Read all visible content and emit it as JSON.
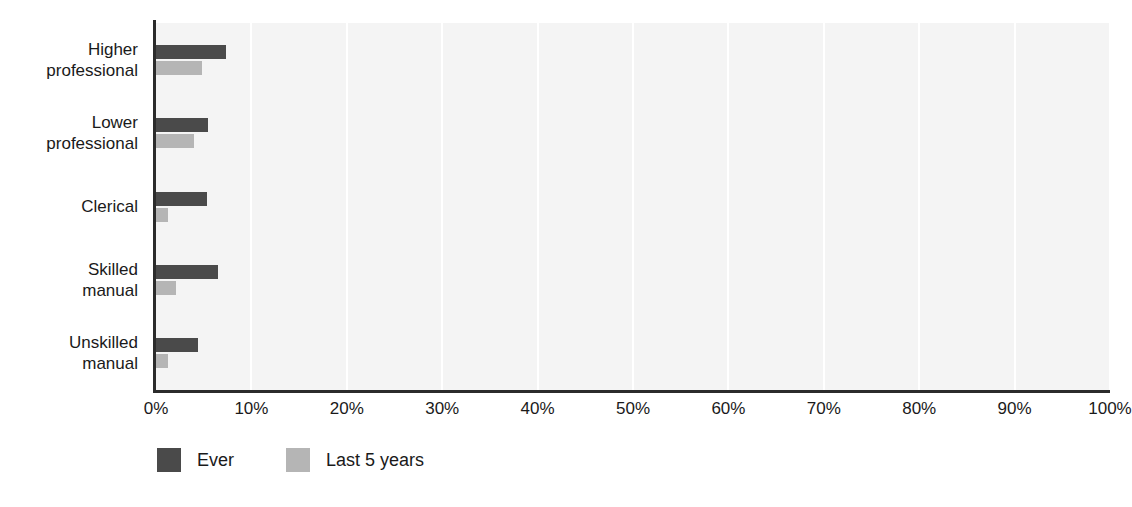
{
  "chart_data": {
    "type": "bar",
    "orientation": "horizontal",
    "title": "",
    "subtitle": "",
    "xlabel": "",
    "ylabel": "",
    "xlim": [
      0,
      100
    ],
    "xtick_labels": [
      "0%",
      "10%",
      "20%",
      "30%",
      "40%",
      "50%",
      "60%",
      "70%",
      "80%",
      "90%",
      "100%"
    ],
    "xtick_values": [
      0,
      10,
      20,
      30,
      40,
      50,
      60,
      70,
      80,
      90,
      100
    ],
    "grid": "vertical",
    "legend_position": "bottom-left",
    "categories": [
      "Higher\nprofessional",
      "Lower\nprofessional",
      "Clerical",
      "Skilled\nmanual",
      "Unskilled\nmanual"
    ],
    "series": [
      {
        "name": "Ever",
        "color": "#4a4a4a",
        "values": [
          7.3,
          5.5,
          5.3,
          6.5,
          4.4
        ]
      },
      {
        "name": "Last 5 years",
        "color": "#b5b5b5",
        "values": [
          4.8,
          4.0,
          1.3,
          2.1,
          1.3
        ]
      }
    ]
  },
  "style": {
    "plot_background": "#f4f4f4",
    "gridline_color": "#ffffff",
    "axis_color": "#2b2b2b",
    "page_background": "#ffffff",
    "text_color": "#1a1a1a"
  }
}
